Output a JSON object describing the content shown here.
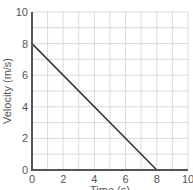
{
  "chart_data": {
    "type": "line",
    "title": "",
    "xlabel": "Time (s)",
    "ylabel": "Velocity (m/s)",
    "xlim": [
      0,
      10
    ],
    "ylim": [
      0,
      10
    ],
    "xticks": [
      0,
      2,
      4,
      6,
      8,
      10
    ],
    "yticks": [
      0,
      2,
      4,
      6,
      8,
      10
    ],
    "grid": true,
    "grid_step": 1,
    "series": [
      {
        "name": "velocity",
        "x": [
          0,
          8
        ],
        "y": [
          8,
          0
        ],
        "color": "#333333"
      }
    ]
  },
  "colors": {
    "axis": "#555555",
    "grid": "#d9d9d9",
    "line": "#333333"
  }
}
